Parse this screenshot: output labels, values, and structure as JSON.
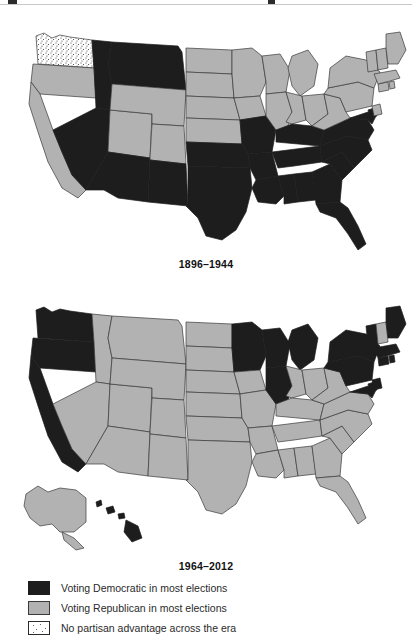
{
  "figure": {
    "maps": [
      {
        "id": "map-1896",
        "caption": "1896–1944",
        "states": {
          "democratic": [
            "ID",
            "MT",
            "NV",
            "AZ",
            "NM",
            "TX",
            "OK",
            "AR",
            "LA",
            "MS",
            "AL",
            "GA",
            "FL",
            "TN",
            "KY",
            "SC",
            "NC",
            "VA",
            "MD",
            "DE",
            "MO"
          ],
          "republican": [
            "OR",
            "CA",
            "UT",
            "WY",
            "CO",
            "ND",
            "SD",
            "NE",
            "KS",
            "MN",
            "IA",
            "WI",
            "IL",
            "MI",
            "IN",
            "OH",
            "WV",
            "PA",
            "NY",
            "NJ",
            "CT",
            "RI",
            "MA",
            "VT",
            "NH",
            "ME"
          ],
          "no_advantage": [
            "WA"
          ]
        }
      },
      {
        "id": "map-1964",
        "caption": "1964–2012",
        "states": {
          "democratic": [
            "WA",
            "OR",
            "CA",
            "HI",
            "MN",
            "WI",
            "MI",
            "IL",
            "PA",
            "NY",
            "NJ",
            "DE",
            "MD",
            "CT",
            "RI",
            "MA",
            "VT",
            "ME"
          ],
          "republican": [
            "AK",
            "ID",
            "MT",
            "NV",
            "UT",
            "AZ",
            "WY",
            "CO",
            "NM",
            "ND",
            "SD",
            "NE",
            "KS",
            "OK",
            "TX",
            "IA",
            "MO",
            "AR",
            "LA",
            "MS",
            "AL",
            "GA",
            "FL",
            "TN",
            "KY",
            "SC",
            "NC",
            "VA",
            "WV",
            "IN",
            "OH",
            "NH"
          ],
          "no_advantage": []
        }
      }
    ],
    "legend": {
      "items": [
        {
          "swatch": "democratic",
          "label": "Voting Democratic in most elections"
        },
        {
          "swatch": "republican",
          "label": "Voting Republican in most elections"
        },
        {
          "swatch": "no-advantage",
          "label": "No partisan advantage across the era"
        }
      ]
    },
    "colors": {
      "democratic": "#1d1d1d",
      "republican": "#b2b2b2",
      "no_advantage": "#ffffff",
      "border": "#3a3a3a"
    }
  }
}
